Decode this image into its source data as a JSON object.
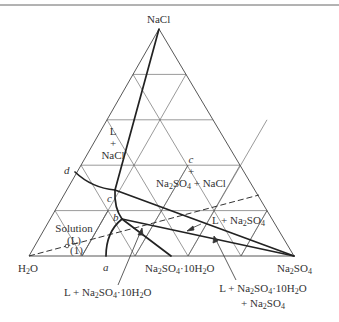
{
  "diagram": {
    "vertices": {
      "top": {
        "label": "NaCl",
        "x": 159,
        "y": 29
      },
      "left": {
        "label": "H2O",
        "x": 29,
        "y": 256
      },
      "right": {
        "label": "Na2SO4",
        "x": 294,
        "y": 256
      }
    },
    "grid_divisions": 5,
    "points": {
      "a": {
        "label": "a",
        "x": 106,
        "y": 256
      },
      "b": {
        "label": "b",
        "x": 122,
        "y": 219
      },
      "c": {
        "label": "c",
        "x": 115,
        "y": 190
      },
      "d": {
        "label": "d",
        "x": 75,
        "y": 172
      },
      "decahydrate": {
        "label": "Na2SO4·10H2O",
        "x": 171,
        "y": 256
      },
      "solution_point_1": {
        "label": "(1)",
        "x": 67,
        "y": 246
      }
    },
    "regions": {
      "l_nacl": {
        "line1": "L",
        "line2": "+",
        "line3": "NaCl"
      },
      "three_phase": {
        "line1": "c",
        "line2": "+",
        "line3": "Na2SO4 + NaCl"
      },
      "solution": {
        "line1": "Solution",
        "line2": "(L)",
        "line3": "(1)"
      },
      "l_na2so4": "L + Na2SO4",
      "l_decahydrate": "L + Na2SO4·10H2O",
      "l_decahydrate_na2so4": {
        "line1": "L + Na2SO4·10H2O",
        "line2": "+ Na2SO4"
      }
    },
    "labels": {
      "nacl": "NaCl",
      "h2o_main": "H",
      "h2o_sub": "2",
      "h2o_end": "O",
      "na": "Na",
      "two": "2",
      "so": "SO",
      "four": "4",
      "deca": "·10H",
      "o": "O",
      "plus_na": "+ Na",
      "l_plus_na": "L + Na",
      "plus_nacl": " + NaCl",
      "a": "a",
      "b": "b",
      "c": "c",
      "d": "d",
      "L": "L",
      "plus": "+",
      "solution": "Solution",
      "L_paren": "(L)",
      "one_paren": "(1)"
    },
    "colors": {
      "line": "#444444",
      "thick_line": "#222222",
      "background": "#ffffff"
    }
  }
}
